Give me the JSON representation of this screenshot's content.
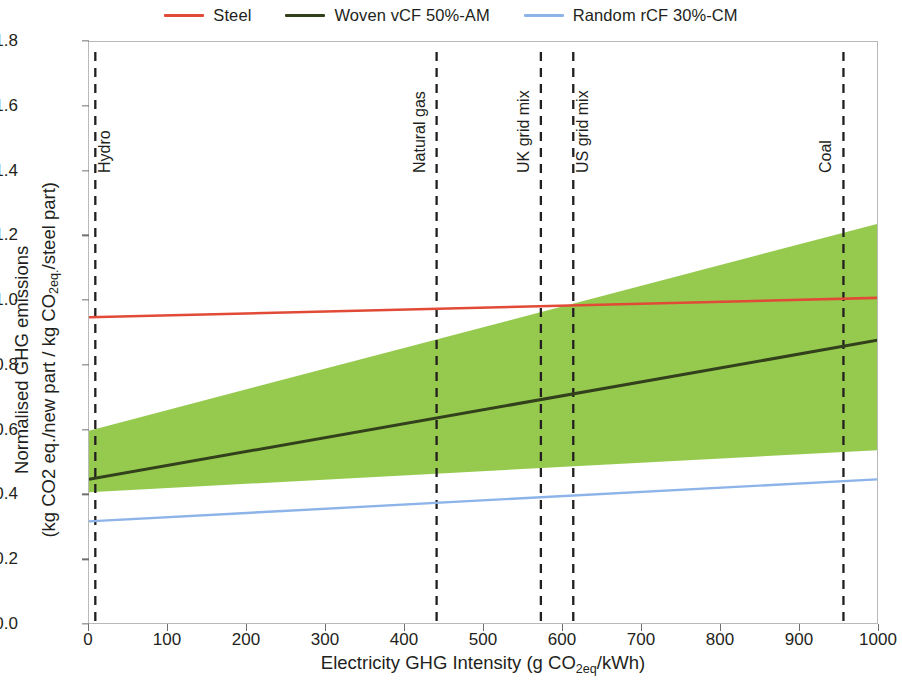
{
  "legend": {
    "items": [
      {
        "label": "Steel",
        "color": "#e04a36"
      },
      {
        "label": "Woven vCF 50%-AM",
        "color": "#32401c"
      },
      {
        "label": "Random rCF 30%-CM",
        "color": "#8cb4e8"
      }
    ]
  },
  "chart_data": {
    "type": "line",
    "title": "",
    "xlabel": "Electricity GHG Intensity (g CO2eq/kWh)",
    "ylabel_line1": "Normalised GHG emissions",
    "ylabel_line2": "(kg CO2 eq./new part / kg CO2eq./steel part)",
    "xlim": [
      0,
      1000
    ],
    "ylim": [
      0,
      1.8
    ],
    "xticks": [
      0,
      100,
      200,
      300,
      400,
      500,
      600,
      700,
      800,
      900,
      1000
    ],
    "xtick_labels": [
      "0",
      "100",
      "200",
      "300",
      "400",
      "500",
      "600",
      "700",
      "800",
      "900",
      "1000"
    ],
    "yticks": [
      0.0,
      0.2,
      0.4,
      0.6,
      0.8,
      1.0,
      1.2,
      1.4,
      1.6,
      1.8
    ],
    "ytick_labels": [
      "0.0",
      "0.2",
      "0.4",
      "0.6",
      "0.8",
      "1.0",
      "1.2",
      "1.4",
      "1.6",
      "1.8"
    ],
    "grid": false,
    "legend_position": "top",
    "series": [
      {
        "name": "Steel",
        "color": "#e04a36",
        "width": 2.6,
        "x": [
          0,
          1000
        ],
        "values": [
          0.95,
          1.01
        ]
      },
      {
        "name": "Woven vCF 50%-AM",
        "color": "#32401c",
        "width": 3.0,
        "x": [
          0,
          1000
        ],
        "values": [
          0.45,
          0.88
        ]
      },
      {
        "name": "Random rCF 30%-CM",
        "color": "#8cb4e8",
        "width": 2.4,
        "x": [
          0,
          1000
        ],
        "values": [
          0.32,
          0.45
        ]
      }
    ],
    "bands": [
      {
        "name": "Woven vCF range",
        "color": "#8cc63f",
        "x": [
          0,
          1000
        ],
        "upper": [
          0.6,
          1.24
        ],
        "lower": [
          0.41,
          0.54
        ]
      }
    ],
    "vertical_markers": [
      {
        "label": "Hydro",
        "x": 8,
        "side": "right"
      },
      {
        "label": "Natural gas",
        "x": 440,
        "side": "left"
      },
      {
        "label": "UK grid mix",
        "x": 572,
        "side": "left"
      },
      {
        "label": "US grid mix",
        "x": 613,
        "side": "right"
      },
      {
        "label": "Coal",
        "x": 955,
        "side": "left"
      }
    ]
  }
}
